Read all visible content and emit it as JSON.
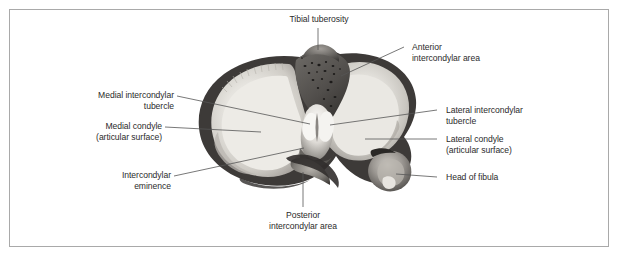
{
  "figure": {
    "kind": "anatomical-illustration",
    "border_color": "#a9a9a9",
    "background_color": "#ffffff",
    "text_color": "#2b2b2b",
    "leader_line_color": "#555555"
  },
  "labels": {
    "tibial_tuberosity": "Tibial tuberosity",
    "anterior_intercondylar_area": "Anterior\nintercondylar area",
    "medial_intercondylar_tubercle": "Medial intercondylar\ntubercle",
    "medial_condyle": "Medial condyle\n(articular surface)",
    "intercondylar_eminence": "Intercondylar\neminence",
    "lateral_intercondylar_tubercle": "Lateral intercondylar\ntubercle",
    "lateral_condyle": "Lateral condyle\n(articular surface)",
    "head_of_fibula": "Head of fibula",
    "posterior_intercondylar_area": "Posterior\nintercondylar area"
  },
  "structures": [
    {
      "name": "tibial-tuberosity",
      "side": "top"
    },
    {
      "name": "anterior-intercondylar-area",
      "side": "right"
    },
    {
      "name": "medial-intercondylar-tubercle",
      "side": "left"
    },
    {
      "name": "medial-condyle",
      "side": "left"
    },
    {
      "name": "intercondylar-eminence",
      "side": "left"
    },
    {
      "name": "lateral-intercondylar-tubercle",
      "side": "right"
    },
    {
      "name": "lateral-condyle",
      "side": "right"
    },
    {
      "name": "head-of-fibula",
      "side": "right"
    },
    {
      "name": "posterior-intercondylar-area",
      "side": "bottom"
    }
  ]
}
